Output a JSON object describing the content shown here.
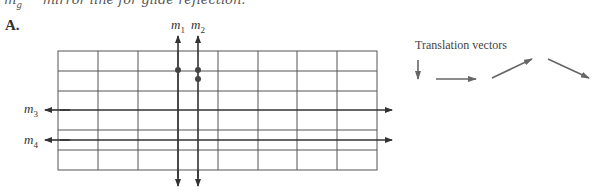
{
  "header": {
    "symbol": "m",
    "symbol_sub": "g",
    "description": "mirror line for glide reflection."
  },
  "panel": {
    "label": "A."
  },
  "mirror_lines": [
    {
      "id": "m1",
      "base": "m",
      "sub": "1",
      "orientation": "vertical"
    },
    {
      "id": "m2",
      "base": "m",
      "sub": "2",
      "orientation": "vertical"
    },
    {
      "id": "m3",
      "base": "m",
      "sub": "3",
      "orientation": "horizontal"
    },
    {
      "id": "m4",
      "base": "m",
      "sub": "4",
      "orientation": "horizontal"
    }
  ],
  "grid": {
    "columns": 8,
    "rows": 6,
    "extra_rows_line": "between rows 5 and 6"
  },
  "translation_vectors": {
    "title": "Translation vectors",
    "vectors": [
      {
        "direction": "down"
      },
      {
        "direction": "right"
      },
      {
        "direction": "up-right"
      },
      {
        "direction": "down-right"
      }
    ]
  },
  "points": [
    {
      "on": "m1",
      "count": 1
    },
    {
      "on": "m2",
      "count": 2
    }
  ],
  "colors": {
    "grid": "#555555",
    "mirror": "#333333",
    "vector": "#666666",
    "dot": "#444444"
  }
}
